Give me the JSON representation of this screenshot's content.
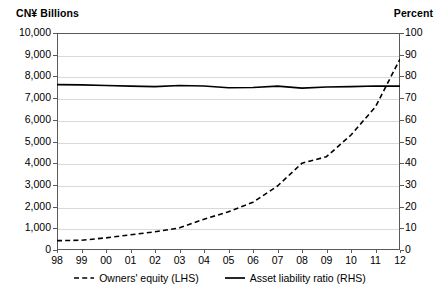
{
  "axis_units": {
    "left": "CN¥ Billions",
    "right": "Percent"
  },
  "chart_data": {
    "type": "line",
    "title": "",
    "xlabel": "",
    "ylabel": "CN¥ Billions",
    "y2label": "Percent",
    "grid": true,
    "legend_position": "bottom",
    "categories": [
      "98",
      "99",
      "00",
      "01",
      "02",
      "03",
      "04",
      "05",
      "06",
      "07",
      "08",
      "09",
      "10",
      "11",
      "12"
    ],
    "ylim": [
      0,
      10000
    ],
    "yticks": [
      "0",
      "1,000",
      "2,000",
      "3,000",
      "4,000",
      "5,000",
      "6,000",
      "7,000",
      "8,000",
      "9,000",
      "10,000"
    ],
    "ytick_values": [
      0,
      1000,
      2000,
      3000,
      4000,
      5000,
      6000,
      7000,
      8000,
      9000,
      10000
    ],
    "y2lim": [
      0,
      100
    ],
    "y2ticks": [
      "0",
      "10",
      "20",
      "30",
      "40",
      "50",
      "60",
      "70",
      "80",
      "90",
      "100"
    ],
    "y2tick_values": [
      0,
      10,
      20,
      30,
      40,
      50,
      60,
      70,
      80,
      90,
      100
    ],
    "series": [
      {
        "name": "Owners' equity (LHS)",
        "axis": "left",
        "style": "dashed",
        "color": "#000000",
        "values": [
          430,
          450,
          560,
          700,
          840,
          1020,
          1420,
          1760,
          2200,
          2950,
          4000,
          4300,
          5300,
          6600,
          8800
        ]
      },
      {
        "name": "Asset liability ratio (RHS)",
        "axis": "right",
        "style": "solid",
        "color": "#000000",
        "values": [
          76.2,
          76.1,
          75.8,
          75.5,
          75.3,
          75.8,
          75.6,
          74.8,
          74.9,
          75.5,
          74.6,
          75.1,
          75.3,
          75.6,
          75.5
        ]
      }
    ]
  },
  "legend": [
    {
      "label": "Owners' equity (LHS)",
      "style": "dashed"
    },
    {
      "label": "Asset liability ratio (RHS)",
      "style": "solid"
    }
  ]
}
